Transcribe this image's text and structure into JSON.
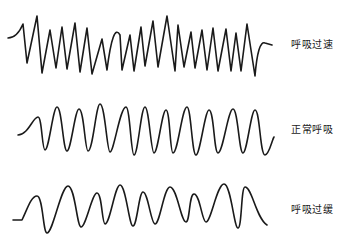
{
  "diagram": {
    "title": "",
    "stroke_color": "#1a1a1a",
    "waves": [
      {
        "id": "rapid",
        "label": "呼吸过速",
        "label_pos": [
          291,
          36
        ],
        "path": "M8,38 Q17,38 23,24 L27,63 L37,16 L42,73 L50,30 L56,68 L62,27 L67,69 L75,23 L80,72 L87,28 L92,74 L102,39 L107,70 Q113,22 120,35 L122,70 L130,35 L134,71 L141,27 L145,66 L153,21 L158,67 L167,16 L175,71 L178,25 L184,67 L191,32 L195,68 L202,30 L207,70 L213,28 L218,71 L226,29 L231,71 L236,33 L241,71 L247,24 L255,76 Q258,40 265,43 L272,45"
      },
      {
        "id": "normal",
        "label": "正常呼吸",
        "label_pos": [
          291,
          121
        ],
        "path": "M18,135 C28,135 33,117 38,117 C42,117 42,150 45,150 C49,150 53,107 57,107 C62,107 63,151 67,151 C71,151 75,109 79,109 C84,109 85,151 88,151 C93,151 96,104 100,104 C105,104 107,152 110,152 C114,152 120,107 126,107 C130,107 131,155 134,155 C138,155 141,107 145,107 C149,107 151,153 154,153 C158,153 162,110 166,110 C170,110 170,153 173,153 C178,153 182,107 187,107 C191,107 192,155 196,155 C200,155 205,110 209,110 C214,110 214,153 218,153 C223,153 228,109 233,109 C238,109 239,153 243,153 C247,153 251,110 255,110 C260,110 260,155 265,155 C269,155 272,140 274,137"
      },
      {
        "id": "slow",
        "label": "呼吸过缓",
        "label_pos": [
          291,
          201
        ],
        "path": "M13,220 L22,220 C27,210 31,196 37,196 C43,196 43,233 47,233 C53,233 61,186 68,186 C75,186 77,227 81,227 C86,227 92,193 97,193 C102,193 102,224 105,224 C110,224 115,185 120,185 C126,185 129,226 133,226 C137,226 139,192 143,192 C148,192 151,224 155,224 C160,224 164,187 170,187 C177,187 181,222 186,222 C190,222 189,194 194,194 C200,194 202,222 206,222 C211,222 217,184 224,184 C231,184 234,228 238,228 C242,228 241,187 245,187 C252,187 256,218 267,225"
      }
    ]
  }
}
